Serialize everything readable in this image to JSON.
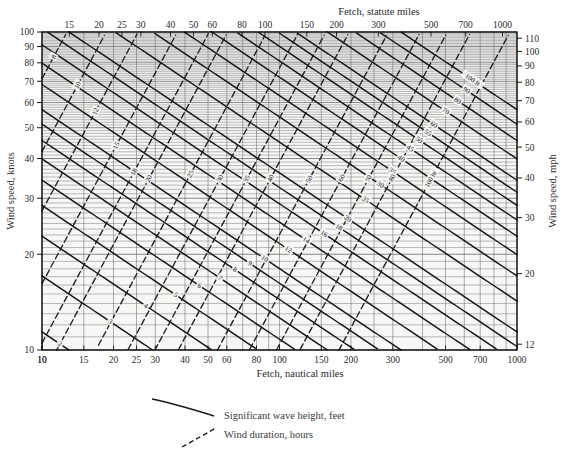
{
  "chart_data": {
    "type": "line",
    "title": "",
    "subtitle": "",
    "chart_kind": "nomogram",
    "axes": {
      "top": {
        "label": "Fetch, statute miles",
        "scale": "log",
        "range": [
          11.5,
          1150
        ],
        "ticks": [
          "1.5",
          "2",
          "2.5",
          "3",
          "4",
          "5",
          "6",
          "7",
          "8",
          "9",
          "10",
          "15",
          "20",
          "25",
          "30",
          "40",
          "50",
          "60",
          "80",
          "100",
          "150",
          "200",
          "300",
          "500",
          "700",
          "1000"
        ]
      },
      "bottom": {
        "label": "Fetch, nautical miles",
        "scale": "log",
        "range": [
          10,
          1000
        ],
        "ticks": [
          "10",
          "1.5",
          "2",
          "2.5",
          "3",
          "4",
          "5",
          "6",
          "7",
          "8",
          "9",
          "10",
          "15",
          "20",
          "25",
          "30",
          "40",
          "50",
          "60",
          "80",
          "100",
          "150",
          "200",
          "300",
          "500",
          "700",
          "1000"
        ]
      },
      "left": {
        "label": "Wind speed, knots",
        "scale": "log",
        "range": [
          10,
          100
        ],
        "ticks": [
          "100",
          "90",
          "80",
          "70",
          "60",
          "50",
          "40",
          "30",
          "20",
          "10"
        ]
      },
      "right": {
        "label": "Wind speed, mph",
        "scale": "log",
        "range": [
          12,
          115
        ],
        "ticks": [
          "110",
          "100",
          "90",
          "80",
          "70",
          "60",
          "50",
          "40",
          "30",
          "20",
          "12"
        ]
      }
    },
    "grid": true,
    "legend": {
      "position": "below-plot",
      "entries": [
        {
          "style": "solid-curve",
          "label": "Significant wave height, feet"
        },
        {
          "style": "dashed-line",
          "label": "Wind duration, hours"
        }
      ]
    },
    "series": [
      {
        "name": "Significant wave height, feet",
        "style": "solid",
        "labels": [
          "1.0 ft",
          "1.5",
          "2",
          "3",
          "4",
          "5",
          "6",
          "7",
          "8",
          "9",
          "10",
          "12",
          "14",
          "16",
          "18",
          "20",
          "25",
          "30",
          "35",
          "40",
          "45",
          "50",
          "55",
          "60",
          "70",
          "80",
          "90",
          "100 ft"
        ],
        "values": [
          1.0,
          1.5,
          2,
          3,
          4,
          5,
          6,
          7,
          8,
          9,
          10,
          12,
          14,
          16,
          18,
          20,
          25,
          30,
          35,
          40,
          45,
          50,
          55,
          60,
          70,
          80,
          90,
          100
        ]
      },
      {
        "name": "Wind duration, hours",
        "style": "dashed",
        "labels": [
          "0.7 hr",
          "1",
          "1.5",
          "2",
          "3",
          "4",
          "5",
          "6",
          "7",
          "8",
          "10",
          "12",
          "15",
          "18",
          "20",
          "25",
          "30",
          "35",
          "40",
          "50",
          "60",
          "70",
          "80",
          "100 hr"
        ],
        "values": [
          0.7,
          1,
          1.5,
          2,
          3,
          4,
          5,
          6,
          7,
          8,
          10,
          12,
          15,
          18,
          20,
          25,
          30,
          35,
          40,
          50,
          60,
          70,
          80,
          100
        ]
      }
    ]
  },
  "plot": {
    "frame_color": "#000000",
    "grid_color": "#555555",
    "wave_color": "#111111",
    "duration_color": "#222222",
    "background": "#f7f7f5"
  },
  "top_axis": {
    "title": "Fetch, statute miles",
    "ticks": [
      {
        "label": "1.5",
        "v": 1.5
      },
      {
        "label": "2",
        "v": 2
      },
      {
        "label": "2.5",
        "v": 2.5
      },
      {
        "label": "3",
        "v": 3
      },
      {
        "label": "4",
        "v": 4
      },
      {
        "label": "5",
        "v": 5
      },
      {
        "label": "6",
        "v": 6
      },
      {
        "label": "7",
        "v": 7
      },
      {
        "label": "8",
        "v": 8
      },
      {
        "label": "9",
        "v": 9
      },
      {
        "label": "10",
        "v": 10
      },
      {
        "label": "15",
        "v": 15
      },
      {
        "label": "20",
        "v": 20
      },
      {
        "label": "25",
        "v": 25
      },
      {
        "label": "30",
        "v": 30
      },
      {
        "label": "40",
        "v": 40
      },
      {
        "label": "50",
        "v": 50
      },
      {
        "label": "60",
        "v": 60
      },
      {
        "label": "80",
        "v": 80
      },
      {
        "label": "100",
        "v": 100
      },
      {
        "label": "150",
        "v": 150
      },
      {
        "label": "200",
        "v": 200
      },
      {
        "label": "300",
        "v": 300
      },
      {
        "label": "500",
        "v": 500
      },
      {
        "label": "700",
        "v": 700
      },
      {
        "label": "1000",
        "v": 1000
      }
    ]
  },
  "bottom_axis": {
    "title": "Fetch, nautical miles",
    "ticks": [
      {
        "label": "10",
        "v": 10
      },
      {
        "label": "1.5",
        "v": 15
      },
      {
        "label": "2",
        "v": 20
      },
      {
        "label": "2.5",
        "v": 25
      },
      {
        "label": "3",
        "v": 30
      },
      {
        "label": "4",
        "v": 40
      },
      {
        "label": "5",
        "v": 50
      },
      {
        "label": "6",
        "v": 60
      },
      {
        "label": "7",
        "v": 70
      },
      {
        "label": "8",
        "v": 80
      },
      {
        "label": "9",
        "v": 90
      },
      {
        "label": "10",
        "v": 100
      },
      {
        "label": "15",
        "v": 150
      },
      {
        "label": "20",
        "v": 200
      },
      {
        "label": "25",
        "v": 250
      },
      {
        "label": "30",
        "v": 300
      },
      {
        "label": "40",
        "v": 400
      },
      {
        "label": "50",
        "v": 500
      },
      {
        "label": "60",
        "v": 600
      },
      {
        "label": "80",
        "v": 800
      },
      {
        "label": "100",
        "v": 1000
      },
      {
        "label": "150",
        "v": 1500
      },
      {
        "label": "200",
        "v": 2000
      },
      {
        "label": "300",
        "v": 3000
      },
      {
        "label": "500",
        "v": 5000
      },
      {
        "label": "700",
        "v": 7000
      },
      {
        "label": "1000",
        "v": 10000
      }
    ]
  },
  "left_axis": {
    "title": "Wind speed, knots",
    "ticks": [
      "100",
      "90",
      "80",
      "70",
      "60",
      "50",
      "40",
      "30",
      "20",
      "10"
    ]
  },
  "right_axis": {
    "title": "Wind speed, mph",
    "ticks": [
      "110",
      "100",
      "90",
      "80",
      "70",
      "60",
      "50",
      "40",
      "30",
      "20",
      "12"
    ]
  },
  "legend": {
    "wave_label": "Significant wave height, feet",
    "duration_label": "Wind duration, hours"
  }
}
